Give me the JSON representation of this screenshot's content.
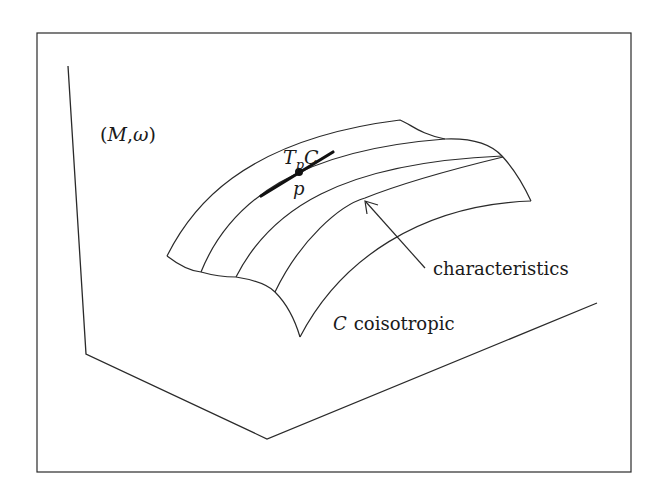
{
  "diagram": {
    "manifold_label": "(M,ω)",
    "manifold_label_parts": {
      "M": "M",
      "sep": ",",
      "omega": "ω",
      "open": "(",
      "close": ")"
    },
    "tangent_label": {
      "T": "T",
      "sub": "p",
      "C": "C"
    },
    "point_label": "p",
    "characteristics_label": "characteristics",
    "submanifold_label": {
      "C": "C",
      "text": "coisotropic"
    },
    "stroke_color": "#2a2a2a",
    "background": "#ffffff"
  }
}
